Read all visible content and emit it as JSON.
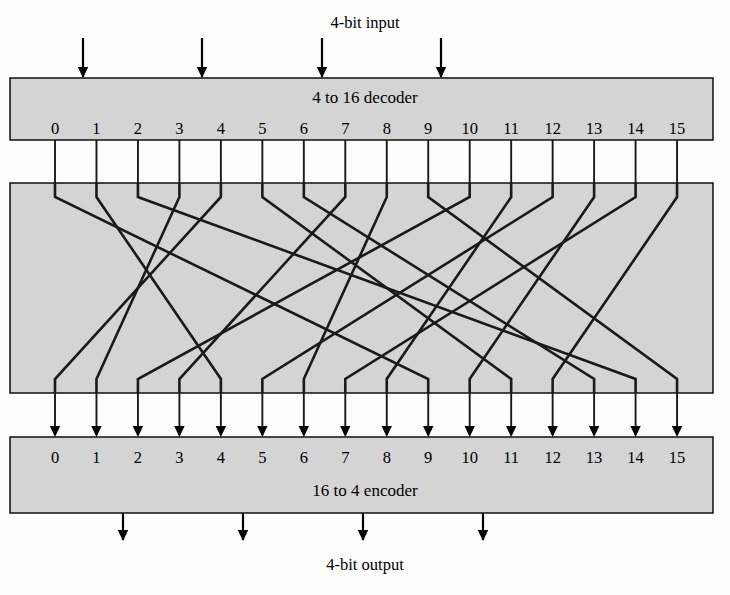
{
  "figure": {
    "title_top": "4-bit input",
    "title_bottom": "4-bit output",
    "decoder_label": "4 to 16 decoder",
    "encoder_label": "16 to 4 encoder",
    "colors": {
      "box_fill": "#d4d4d4",
      "line": "#1a1a1a",
      "background": "#fdfdfb"
    }
  },
  "decoder": {
    "label": "4 to 16 decoder",
    "pin_labels": [
      "0",
      "1",
      "2",
      "3",
      "4",
      "5",
      "6",
      "7",
      "8",
      "9",
      "10",
      "11",
      "12",
      "13",
      "14",
      "15"
    ],
    "input_arrow_count": 4
  },
  "permutation_box": {
    "name": "crossbar-permutation-region"
  },
  "encoder": {
    "label": "16 to 4 encoder",
    "pin_labels": [
      "0",
      "1",
      "2",
      "3",
      "4",
      "5",
      "6",
      "7",
      "8",
      "9",
      "10",
      "11",
      "12",
      "13",
      "14",
      "15"
    ],
    "output_arrow_count": 4
  },
  "chart_data": {
    "type": "diagram",
    "mapping_note": "Each decoder output index maps to one encoder input index through the crossing wires.",
    "mapping": [
      {
        "from": 0,
        "to": 9
      },
      {
        "from": 1,
        "to": 4
      },
      {
        "from": 2,
        "to": 14
      },
      {
        "from": 3,
        "to": 1
      },
      {
        "from": 4,
        "to": 0
      },
      {
        "from": 5,
        "to": 11
      },
      {
        "from": 6,
        "to": 13
      },
      {
        "from": 7,
        "to": 3
      },
      {
        "from": 8,
        "to": 6
      },
      {
        "from": 9,
        "to": 15
      },
      {
        "from": 10,
        "to": 2
      },
      {
        "from": 11,
        "to": 8
      },
      {
        "from": 12,
        "to": 5
      },
      {
        "from": 13,
        "to": 10
      },
      {
        "from": 14,
        "to": 7
      },
      {
        "from": 15,
        "to": 12
      }
    ]
  },
  "geometry": {
    "pin0_x": 55,
    "pin_spacing": 41.47,
    "box_left": 10,
    "box_right": 713,
    "decoder_top": 78,
    "decoder_bottom": 140,
    "mid_top": 183,
    "mid_bottom": 393,
    "encoder_top": 437,
    "encoder_bottom": 513,
    "input_arrow_xs": [
      83,
      202,
      322,
      441
    ],
    "output_arrow_xs": [
      123,
      243,
      363,
      483
    ]
  }
}
